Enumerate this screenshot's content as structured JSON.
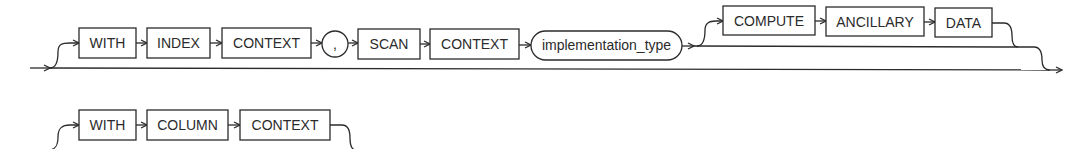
{
  "diagram": {
    "type": "railroad-syntax-diagram",
    "row1": {
      "optional_group_1": {
        "keywords": [
          "WITH",
          "INDEX",
          "CONTEXT"
        ],
        "separator": ",",
        "keywords_after_separator": [
          "SCAN",
          "CONTEXT"
        ],
        "nonterminal": "implementation_type"
      },
      "optional_group_2": {
        "keywords": [
          "COMPUTE",
          "ANCILLARY",
          "DATA"
        ]
      }
    },
    "row2": {
      "optional_group_1": {
        "keywords": [
          "WITH",
          "COLUMN",
          "CONTEXT"
        ]
      }
    }
  },
  "colors": {
    "line": "#2b2b2b",
    "text": "#2b2b2b",
    "background": "#ffffff"
  }
}
